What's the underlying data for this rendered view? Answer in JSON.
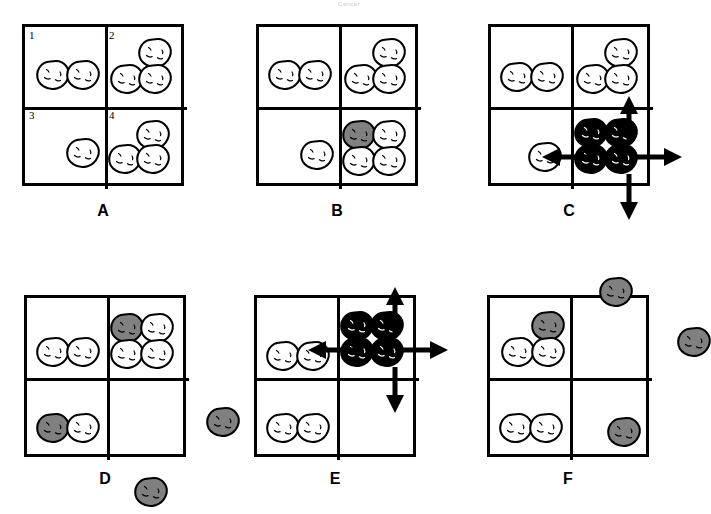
{
  "figure": {
    "header_note": "Cancer",
    "colors": {
      "outline": "#000000",
      "blob_white": "#ffffff",
      "blob_gray": "#808080",
      "blob_black": "#000000",
      "grid_border": "#000000",
      "arrow": "#000000"
    },
    "quadrant_numbers": [
      "1",
      "2",
      "3",
      "4"
    ],
    "panels": [
      {
        "id": "A",
        "label": "A",
        "show_quadrant_numbers": true,
        "quadrants": [
          {
            "n": "1",
            "blobs": [
              {
                "fill": "white",
                "x": 14,
                "y": 36
              },
              {
                "fill": "white",
                "x": 44,
                "y": 36
              }
            ]
          },
          {
            "n": "2",
            "blobs": [
              {
                "fill": "white",
                "x": 116,
                "y": 14
              },
              {
                "fill": "white",
                "x": 88,
                "y": 40
              },
              {
                "fill": "white",
                "x": 116,
                "y": 40
              }
            ]
          },
          {
            "n": "3",
            "blobs": [
              {
                "fill": "white",
                "x": 44,
                "y": 114
              }
            ]
          },
          {
            "n": "4",
            "blobs": [
              {
                "fill": "white",
                "x": 114,
                "y": 96
              },
              {
                "fill": "white",
                "x": 86,
                "y": 120
              },
              {
                "fill": "white",
                "x": 114,
                "y": 120
              }
            ]
          }
        ],
        "outside_blobs": [],
        "arrows": []
      },
      {
        "id": "B",
        "label": "B",
        "show_quadrant_numbers": false,
        "quadrants": [
          {
            "n": "1",
            "blobs": [
              {
                "fill": "white",
                "x": 12,
                "y": 36
              },
              {
                "fill": "white",
                "x": 42,
                "y": 36
              }
            ]
          },
          {
            "n": "2",
            "blobs": [
              {
                "fill": "white",
                "x": 116,
                "y": 14
              },
              {
                "fill": "white",
                "x": 88,
                "y": 40
              },
              {
                "fill": "white",
                "x": 116,
                "y": 40
              }
            ]
          },
          {
            "n": "3",
            "blobs": [
              {
                "fill": "white",
                "x": 44,
                "y": 116
              }
            ]
          },
          {
            "n": "4",
            "blobs": [
              {
                "fill": "gray",
                "x": 86,
                "y": 96
              },
              {
                "fill": "white",
                "x": 116,
                "y": 96
              },
              {
                "fill": "white",
                "x": 86,
                "y": 122
              },
              {
                "fill": "white",
                "x": 116,
                "y": 122
              }
            ]
          }
        ],
        "outside_blobs": [],
        "arrows": []
      },
      {
        "id": "C",
        "label": "C",
        "show_quadrant_numbers": false,
        "quadrants": [
          {
            "n": "1",
            "blobs": [
              {
                "fill": "white",
                "x": 12,
                "y": 38
              },
              {
                "fill": "white",
                "x": 42,
                "y": 38
              }
            ]
          },
          {
            "n": "2",
            "blobs": [
              {
                "fill": "white",
                "x": 116,
                "y": 14
              },
              {
                "fill": "white",
                "x": 88,
                "y": 40
              },
              {
                "fill": "white",
                "x": 116,
                "y": 40
              }
            ]
          },
          {
            "n": "3",
            "blobs": [
              {
                "fill": "white",
                "x": 40,
                "y": 118
              }
            ]
          },
          {
            "n": "4",
            "blobs": [
              {
                "fill": "black",
                "x": 86,
                "y": 94
              },
              {
                "fill": "black",
                "x": 116,
                "y": 94
              },
              {
                "fill": "black",
                "x": 86,
                "y": 120
              },
              {
                "fill": "black",
                "x": 116,
                "y": 120
              }
            ]
          }
        ],
        "outside_blobs": [],
        "arrows": [
          {
            "dir": "up",
            "x": 124,
            "y": 72
          },
          {
            "dir": "down",
            "x": 124,
            "y": 150
          },
          {
            "dir": "left",
            "x": 54,
            "y": 116
          },
          {
            "dir": "right",
            "x": 148,
            "y": 116
          }
        ]
      },
      {
        "id": "D",
        "label": "D",
        "show_quadrant_numbers": false,
        "quadrants": [
          {
            "n": "1",
            "blobs": [
              {
                "fill": "white",
                "x": 12,
                "y": 42
              },
              {
                "fill": "white",
                "x": 42,
                "y": 42
              }
            ]
          },
          {
            "n": "2",
            "blobs": [
              {
                "fill": "gray",
                "x": 86,
                "y": 18
              },
              {
                "fill": "white",
                "x": 116,
                "y": 18
              },
              {
                "fill": "white",
                "x": 86,
                "y": 44
              },
              {
                "fill": "white",
                "x": 116,
                "y": 44
              }
            ]
          },
          {
            "n": "3",
            "blobs": [
              {
                "fill": "gray",
                "x": 12,
                "y": 118
              },
              {
                "fill": "white",
                "x": 42,
                "y": 118
              }
            ]
          },
          {
            "n": "4",
            "blobs": []
          }
        ],
        "outside_blobs": [
          {
            "fill": "gray",
            "x": 182,
            "y": 112
          },
          {
            "fill": "gray",
            "x": 110,
            "y": 182
          }
        ],
        "arrows": []
      },
      {
        "id": "E",
        "label": "E",
        "show_quadrant_numbers": false,
        "quadrants": [
          {
            "n": "1",
            "blobs": [
              {
                "fill": "white",
                "x": 12,
                "y": 46
              },
              {
                "fill": "white",
                "x": 42,
                "y": 46
              }
            ]
          },
          {
            "n": "2",
            "blobs": [
              {
                "fill": "black",
                "x": 86,
                "y": 16
              },
              {
                "fill": "black",
                "x": 116,
                "y": 16
              },
              {
                "fill": "black",
                "x": 86,
                "y": 42
              },
              {
                "fill": "black",
                "x": 116,
                "y": 42
              }
            ]
          },
          {
            "n": "3",
            "blobs": [
              {
                "fill": "white",
                "x": 12,
                "y": 118
              },
              {
                "fill": "white",
                "x": 42,
                "y": 118
              }
            ]
          },
          {
            "n": "4",
            "blobs": []
          }
        ],
        "outside_blobs": [],
        "arrows": [
          {
            "dir": "up",
            "x": 124,
            "y": -8
          },
          {
            "dir": "down",
            "x": 124,
            "y": 72
          },
          {
            "dir": "left",
            "x": 54,
            "y": 38
          },
          {
            "dir": "right",
            "x": 148,
            "y": 38
          }
        ]
      },
      {
        "id": "F",
        "label": "F",
        "show_quadrant_numbers": false,
        "quadrants": [
          {
            "n": "1",
            "blobs": [
              {
                "fill": "gray",
                "x": 44,
                "y": 16
              },
              {
                "fill": "white",
                "x": 14,
                "y": 42
              },
              {
                "fill": "white",
                "x": 44,
                "y": 42
              }
            ]
          },
          {
            "n": "2",
            "blobs": []
          },
          {
            "n": "3",
            "blobs": [
              {
                "fill": "white",
                "x": 12,
                "y": 118
              },
              {
                "fill": "white",
                "x": 42,
                "y": 118
              }
            ]
          },
          {
            "n": "4",
            "blobs": [
              {
                "fill": "gray",
                "x": 120,
                "y": 122
              }
            ]
          }
        ],
        "outside_blobs": [
          {
            "fill": "gray",
            "x": 112,
            "y": -18
          },
          {
            "fill": "gray",
            "x": 190,
            "y": 32
          }
        ],
        "arrows": []
      }
    ]
  }
}
